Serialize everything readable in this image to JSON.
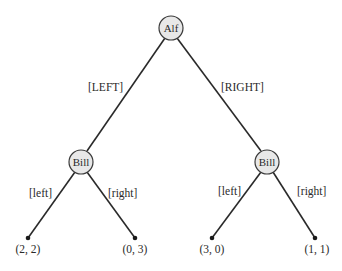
{
  "diagram": {
    "type": "game-tree",
    "nodes": [
      {
        "id": "alf",
        "label": "Alf",
        "x": 171,
        "y": 28
      },
      {
        "id": "bill_left",
        "label": "Bill",
        "x": 81,
        "y": 162
      },
      {
        "id": "bill_right",
        "label": "Bill",
        "x": 267,
        "y": 162
      }
    ],
    "edges": [
      {
        "from": "alf",
        "to": "bill_left",
        "label": "[LEFT]"
      },
      {
        "from": "alf",
        "to": "bill_right",
        "label": "[RIGHT]"
      },
      {
        "from": "bill_left",
        "to": "leaf1",
        "label": "[left]"
      },
      {
        "from": "bill_left",
        "to": "leaf2",
        "label": "[right]"
      },
      {
        "from": "bill_right",
        "to": "leaf3",
        "label": "[left]"
      },
      {
        "from": "bill_right",
        "to": "leaf4",
        "label": "[right]"
      }
    ],
    "leaves": [
      {
        "id": "leaf1",
        "payoff": "(2, 2)",
        "x": 28,
        "y": 238
      },
      {
        "id": "leaf2",
        "payoff": "(0, 3)",
        "x": 135,
        "y": 238
      },
      {
        "id": "leaf3",
        "payoff": "(3, 0)",
        "x": 212,
        "y": 238
      },
      {
        "id": "leaf4",
        "payoff": "(1, 1)",
        "x": 315,
        "y": 238
      }
    ]
  }
}
